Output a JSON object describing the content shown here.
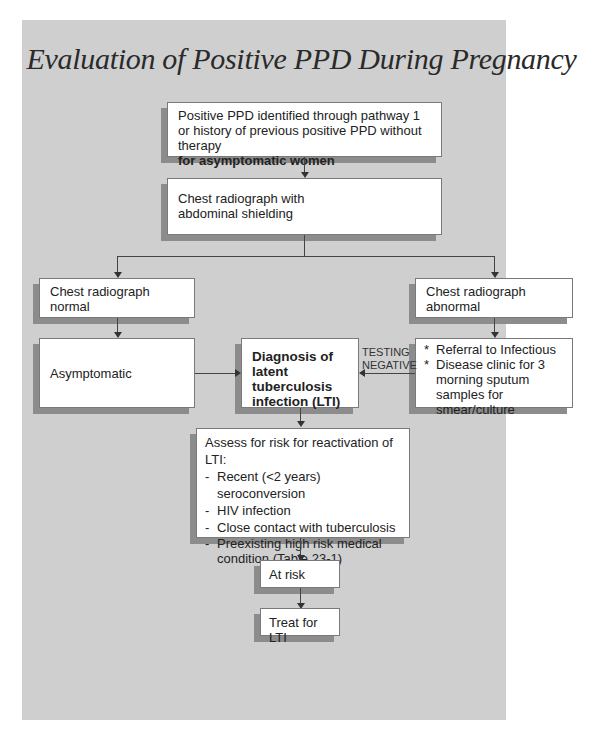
{
  "title": "Evaluation of Positive PPD During Pregnancy",
  "nodes": {
    "start": {
      "line1": "Positive PPD identified through pathway 1",
      "line2": "or history of previous positive PPD without therapy",
      "line3": "for asymptomatic women"
    },
    "xray": {
      "line1": "Chest radiograph with",
      "line2": "abdominal shielding"
    },
    "normal": {
      "line1": "Chest radiograph",
      "line2": "normal"
    },
    "abnormal": {
      "line1": "Chest radiograph",
      "line2": "abnormal"
    },
    "asymptomatic": {
      "label": "Asymptomatic"
    },
    "diagnosis": {
      "line1": "Diagnosis of latent",
      "line2": "tuberculosis",
      "line3": "infection (LTI)"
    },
    "referral": {
      "bullet": "*",
      "items": [
        "Referral to Infectious",
        "Disease clinic for 3 morning sputum samples for smear/culture"
      ]
    },
    "assess": {
      "heading": "Assess for risk for reactivation of LTI:",
      "bullet": "-",
      "items": [
        "Recent (<2 years) seroconversion",
        "HIV infection",
        "Close contact with tuberculosis",
        "Preexisting high risk medical condition (Table 23-1)"
      ]
    },
    "at_risk": {
      "label": "At risk"
    },
    "treat": {
      "label": "Treat for LTI"
    }
  },
  "edges": {
    "testing_negative": {
      "line1": "TESTING",
      "line2": "NEGATIVE"
    }
  },
  "colors": {
    "panel_bg": "#cfcfcf",
    "box_bg": "#ffffff",
    "shadow": "#8c8c8c",
    "line": "#444444"
  }
}
